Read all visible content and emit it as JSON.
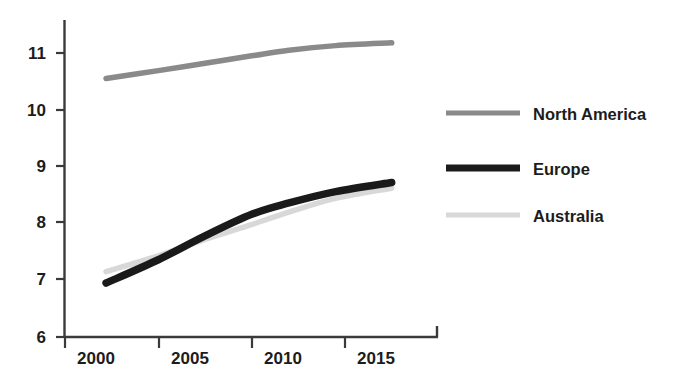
{
  "chart_data": {
    "type": "line",
    "title": "",
    "xlabel": "",
    "ylabel": "",
    "xlim": [
      2000,
      2018
    ],
    "ylim": [
      6,
      11.5
    ],
    "xticks": [
      2000,
      2005,
      2010,
      2015
    ],
    "yticks": [
      6,
      7,
      8,
      9,
      10,
      11
    ],
    "xtick_labels": [
      "2000",
      "2005",
      "2010",
      "2015"
    ],
    "ytick_labels": [
      "6",
      "7",
      "8",
      "9",
      "10",
      "11"
    ],
    "grid": false,
    "legend_position": "right",
    "series": [
      {
        "name": "North America",
        "color": "#8a8a8a",
        "x": [
          2002.2,
          2005,
          2007.5,
          2010,
          2012,
          2014.5,
          2017.5
        ],
        "values": [
          10.55,
          10.69,
          10.82,
          10.95,
          11.05,
          11.13,
          11.18
        ]
      },
      {
        "name": "Europe",
        "color": "#1a1a1a",
        "x": [
          2002.2,
          2005,
          2007.5,
          2010,
          2012,
          2014.5,
          2017.5
        ],
        "values": [
          6.95,
          7.36,
          7.78,
          8.16,
          8.36,
          8.56,
          8.72
        ]
      },
      {
        "name": "Australia",
        "color": "#d8d8d8",
        "x": [
          2002.2,
          2005,
          2007.5,
          2010,
          2012,
          2014.5,
          2017.5
        ],
        "values": [
          7.15,
          7.43,
          7.72,
          7.98,
          8.2,
          8.44,
          8.62
        ]
      }
    ]
  },
  "axes": {
    "y_labels": [
      "11",
      "10",
      "9",
      "8",
      "7",
      "6"
    ],
    "x_labels": [
      "2000",
      "2005",
      "2010",
      "2015"
    ]
  },
  "legend": {
    "items": [
      {
        "label": "North America",
        "color": "#8a8a8a",
        "thickness": 5
      },
      {
        "label": "Europe",
        "color": "#1a1a1a",
        "thickness": 7
      },
      {
        "label": "Australia",
        "color": "#d8d8d8",
        "thickness": 5
      }
    ]
  },
  "colors": {
    "axis": "#3a3a3a",
    "text": "#1c1c1c",
    "background": "#ffffff",
    "north_america": "#8a8a8a",
    "europe": "#1a1a1a",
    "australia": "#d8d8d8"
  }
}
